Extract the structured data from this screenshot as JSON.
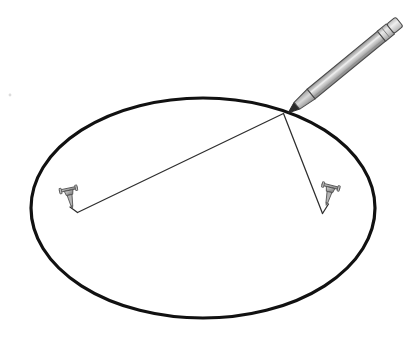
{
  "figure": {
    "name": "ellipse-string-and-pins-construction",
    "alt_text": "A large horizontal ellipse drawn in black. Two thumbtacks are pushed inside the ellipse at the foci. A pencil rests at a point on the ellipse edge at the upper right, with thin string lines running from the pencil tip to each thumbtack.",
    "background_color": "#ffffff",
    "width": 417,
    "height": 344
  },
  "canvas": {
    "width": 417,
    "height": 344
  },
  "ellipse": {
    "label": "ellipse-outline",
    "center_x": 203,
    "center_y": 208,
    "radius_x": 172,
    "radius_y": 110,
    "stroke_color": "#111111",
    "stroke_width": 3.2,
    "fill": "none"
  },
  "pencil": {
    "label": "pencil",
    "tip_x": 288,
    "tip_y": 113,
    "end_x": 400,
    "end_y": 21,
    "barrel_width": 12.5,
    "barrel_color_light": "#d7d7d7",
    "barrel_color_mid": "#a8a8a8",
    "barrel_color_dark": "#8a8a8a",
    "outline_color": "#4a4a4a",
    "tip_wood_color": "#bdbdbd",
    "graphite_color": "#2a2a2a",
    "ferrule_color": "#cfcfcf",
    "cap_color": "#e2e2e2"
  },
  "pins": [
    {
      "label": "thumbtack-left-focus",
      "head_x": 69,
      "head_y": 196,
      "base_x": 71,
      "base_y": 208,
      "body_color": "#9a9a9a",
      "outline_color": "#4f4f4f",
      "rotation_deg": -12
    },
    {
      "label": "thumbtack-right-focus",
      "head_x": 330,
      "head_y": 192,
      "base_x": 326,
      "base_y": 206,
      "body_color": "#9a9a9a",
      "outline_color": "#4f4f4f",
      "rotation_deg": 14
    }
  ],
  "strings": [
    {
      "label": "string-to-left-pin",
      "from_x": 283,
      "from_y": 113,
      "to_x": 77,
      "to_y": 212,
      "tail_x": 69,
      "tail_y": 207,
      "stroke_color": "#2e2e2e",
      "stroke_width": 1.2
    },
    {
      "label": "string-to-right-pin",
      "from_x": 283,
      "from_y": 113,
      "to_x": 323,
      "to_y": 213,
      "tail_x": 328,
      "tail_y": 205,
      "stroke_color": "#2e2e2e",
      "stroke_width": 1.2
    }
  ],
  "speck": {
    "label": "paper-speck",
    "x": 10,
    "y": 95,
    "radius": 1.4,
    "color": "#d9d9d9"
  }
}
